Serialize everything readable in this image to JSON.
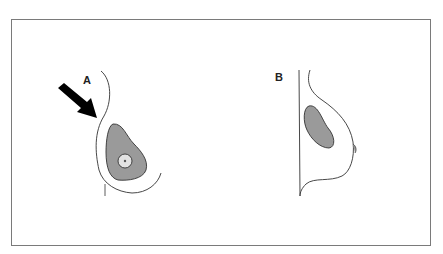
{
  "figure": {
    "panels": [
      {
        "label": "A",
        "description": "Lateral breast profile with arrow pointing at lateral chest, shaded glandular region with circular lesion"
      },
      {
        "label": "B",
        "description": "Lateral breast profile with shaded glandular region"
      }
    ],
    "colors": {
      "frame": "#7a7a7a",
      "outline": "#333333",
      "gland_fill": "#9a9a9a",
      "lesion_fill": "#e2e2e2",
      "arrow": "#000000"
    }
  }
}
